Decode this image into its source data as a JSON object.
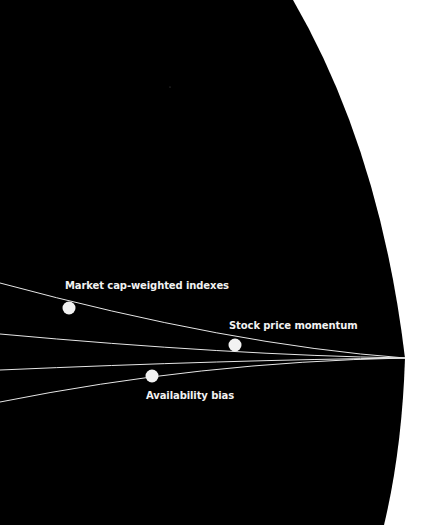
{
  "diagram": {
    "background_color": "#ffffff",
    "field_color": "#000000",
    "line_color": "#e6e6e6",
    "dot_color": "#f2f2f2",
    "convergence_point": {
      "x": 405,
      "y": 358
    },
    "lines": [
      {
        "id": "line-1",
        "start": {
          "x": 0,
          "y": 283
        },
        "control": {
          "x": 230,
          "y": 345
        }
      },
      {
        "id": "line-2",
        "start": {
          "x": 0,
          "y": 334
        },
        "control": {
          "x": 230,
          "y": 355
        }
      },
      {
        "id": "line-3",
        "start": {
          "x": 0,
          "y": 370
        },
        "control": {
          "x": 230,
          "y": 360
        }
      },
      {
        "id": "line-4",
        "start": {
          "x": 0,
          "y": 402
        },
        "control": {
          "x": 200,
          "y": 362
        }
      }
    ],
    "points": [
      {
        "label": "Market cap-weighted indexes",
        "x": 69,
        "y": 308
      },
      {
        "label": "Stock price momentum",
        "x": 235,
        "y": 345
      },
      {
        "label": "Availability bias",
        "x": 152,
        "y": 376
      }
    ]
  }
}
